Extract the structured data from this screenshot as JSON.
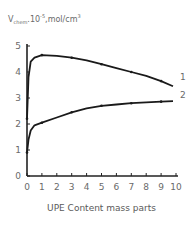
{
  "chart_data": {
    "type": "line",
    "title": "",
    "ylabel_main": "V",
    "ylabel_sub": "chem",
    "ylabel_rest": ".10",
    "ylabel_exp": "-5",
    "ylabel_unit": ",mol/cm",
    "ylabel_unit_exp": "3",
    "xlabel": "UPE Content mass parts",
    "xlim": [
      0,
      10
    ],
    "ylim": [
      0,
      5
    ],
    "x_ticks": [
      "0",
      "1",
      "2",
      "3",
      "4",
      "5",
      "6",
      "7",
      "8",
      "9",
      "10"
    ],
    "y_ticks": [
      "0",
      "1",
      "2",
      "3",
      "4",
      "5"
    ],
    "grid": false,
    "legend": "inline curve labels at right end",
    "series": [
      {
        "name": "1",
        "x": [
          0,
          0.1,
          0.25,
          0.5,
          1,
          2,
          3,
          4,
          5,
          6,
          7,
          8,
          9,
          9.8
        ],
        "values": [
          2.2,
          3.8,
          4.4,
          4.55,
          4.65,
          4.62,
          4.55,
          4.45,
          4.3,
          4.15,
          4.0,
          3.85,
          3.65,
          3.45
        ]
      },
      {
        "name": "2",
        "x": [
          0,
          0.1,
          0.25,
          0.5,
          1,
          2,
          3,
          4,
          5,
          6,
          7,
          8,
          9,
          9.8
        ],
        "values": [
          0.9,
          1.4,
          1.75,
          1.95,
          2.05,
          2.25,
          2.45,
          2.6,
          2.7,
          2.75,
          2.8,
          2.83,
          2.86,
          2.88
        ]
      }
    ],
    "curve_labels": [
      "1",
      "2"
    ]
  }
}
